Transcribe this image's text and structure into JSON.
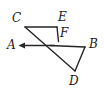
{
  "figure": {
    "type": "geometry-diagram",
    "background_color": "#ffffff",
    "stroke_color": "#262626",
    "label_color": "#1a1a1a",
    "stroke_width": 1.3,
    "width": 104,
    "height": 93
  },
  "labels": [
    {
      "id": "A",
      "text": "A",
      "x": 7,
      "y": 39
    },
    {
      "id": "B",
      "text": "B",
      "x": 89,
      "y": 38
    },
    {
      "id": "C",
      "text": "C",
      "x": 12,
      "y": 12
    },
    {
      "id": "D",
      "text": "D",
      "x": 69,
      "y": 75
    },
    {
      "id": "E",
      "text": "E",
      "x": 58,
      "y": 11
    },
    {
      "id": "F",
      "text": "F",
      "x": 60,
      "y": 27
    }
  ],
  "points": {
    "C": {
      "x": 25,
      "y": 27
    },
    "E": {
      "x": 57,
      "y": 27
    },
    "F": {
      "x": 58,
      "y": 41
    },
    "B": {
      "x": 85,
      "y": 47
    },
    "D": {
      "x": 75,
      "y": 71
    },
    "X": {
      "x": 55,
      "y": 45
    },
    "A_tip": {
      "x": 19,
      "y": 45
    }
  },
  "segments": [
    {
      "name": "segment-CE",
      "from": "C",
      "to": "E"
    },
    {
      "name": "segment-EF",
      "from": "E",
      "to": "F"
    },
    {
      "name": "segment-CD",
      "from": "C",
      "to": "D"
    },
    {
      "name": "segment-XB",
      "from": "X",
      "to": "B"
    },
    {
      "name": "segment-BD",
      "from": "B",
      "to": "D"
    },
    {
      "name": "ray-XA",
      "from": "X",
      "to": "A_tip"
    }
  ],
  "arrows": [
    {
      "name": "arrow-toward-A",
      "direction": "left",
      "at_x": 19,
      "at_y": 45
    }
  ]
}
